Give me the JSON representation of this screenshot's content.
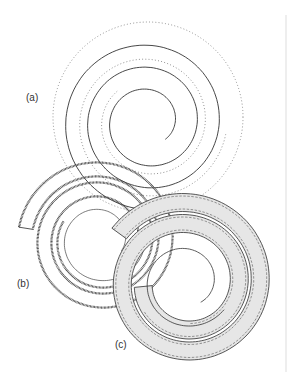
{
  "figure": {
    "panels": [
      {
        "id": "a",
        "label": "(a)",
        "label_pos": [
          26,
          101
        ],
        "style": "outline-with-dotted-guide",
        "center": [
          148,
          122
        ],
        "r_start": 24.5,
        "r_step": 22,
        "turns": 2.9,
        "band_width": 0,
        "outer_dotted_r": 95
      },
      {
        "id": "b",
        "label": "(b)",
        "label_pos": [
          17,
          287
        ],
        "style": "hatched-band",
        "center": [
          100,
          240
        ],
        "r_start": 24,
        "r_step": 20,
        "turns": 2.55,
        "band_width": 14
      },
      {
        "id": "c",
        "label": "(c)",
        "label_pos": [
          115,
          348
        ],
        "style": "gray-filled-band-dashed",
        "center": [
          186,
          282
        ],
        "r_start": 25,
        "r_step": 21,
        "turns": 2.55,
        "band_width": 26
      }
    ],
    "colors": {
      "stroke": "#333333",
      "dotted": "#666666",
      "fill_gray": "#e6e6e6",
      "frame_line": "#dddddd"
    }
  }
}
